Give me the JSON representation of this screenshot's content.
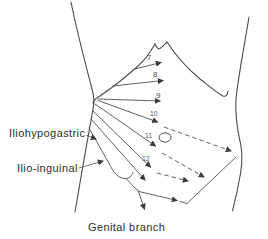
{
  "labels": {
    "iliohypogastric": "Iliohypogastric",
    "ilio_inguinal": "Ilio-inguinal",
    "genital_branch": "Genital branch"
  },
  "nerve_numbers": [
    "7",
    "8",
    "9",
    "10",
    "11",
    "12"
  ],
  "colors": {
    "line": "#4b4b4b",
    "text": "#2e2e2e",
    "background": "#ffffff"
  }
}
